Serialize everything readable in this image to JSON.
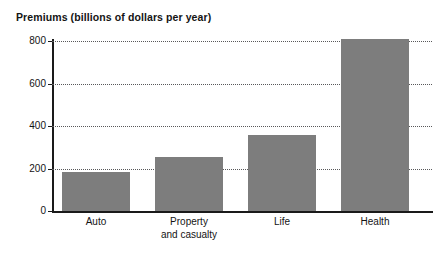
{
  "chart_data": {
    "type": "bar",
    "title": "Premiums (billions of dollars per year)",
    "xlabel": "",
    "ylabel": "",
    "categories": [
      "Auto",
      "Property and casualty",
      "Life",
      "Health"
    ],
    "category_lines": [
      [
        "Auto"
      ],
      [
        "Property",
        "and casualty"
      ],
      [
        "Life"
      ],
      [
        "Health"
      ]
    ],
    "values": [
      185,
      255,
      360,
      810
    ],
    "ylim": [
      0,
      860
    ],
    "yticks": [
      0,
      200,
      400,
      600,
      800
    ],
    "ytick_labels": [
      "0",
      "200",
      "400",
      "600",
      "800"
    ],
    "grid": "horizontal-dotted",
    "legend": "none",
    "bar_color": "#7d7d7d",
    "axis_color": "#1a1a1a",
    "gridline_color": "#58585a",
    "background": "#ffffff"
  }
}
